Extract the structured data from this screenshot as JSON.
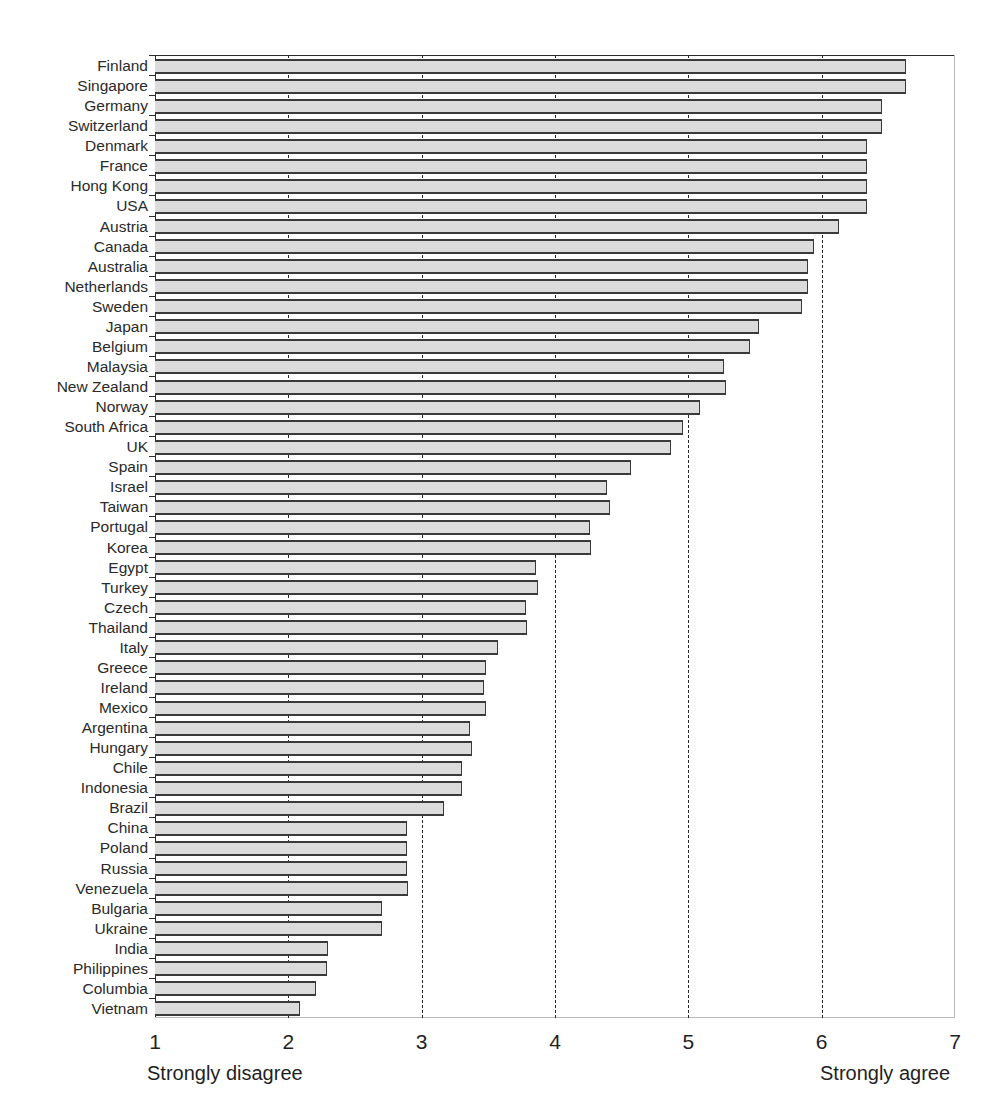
{
  "chart_data": {
    "type": "bar",
    "orientation": "horizontal",
    "title": "",
    "xlabel": "",
    "ylabel": "",
    "xlim": [
      1,
      7
    ],
    "xticks": [
      1,
      2,
      3,
      4,
      5,
      6,
      7
    ],
    "xtick_labels": [
      "1",
      "2",
      "3",
      "4",
      "5",
      "6",
      "7"
    ],
    "gridlines_at": [
      2,
      3,
      4,
      5,
      6
    ],
    "grid": true,
    "legend": null,
    "axis_annotations": {
      "low_anchor": "Strongly disagree",
      "low_anchor_value": 1,
      "high_anchor": "Strongly agree",
      "high_anchor_value": 6
    },
    "bar_color": "#dcdcdc",
    "bar_edge_color": "#3a3a3a",
    "categories": [
      "Finland",
      "Singapore",
      "Germany",
      "Switzerland",
      "Denmark",
      "France",
      "Hong Kong",
      "USA",
      "Austria",
      "Canada",
      "Australia",
      "Netherlands",
      "Sweden",
      "Japan",
      "Belgium",
      "Malaysia",
      "New Zealand",
      "Norway",
      "South Africa",
      "UK",
      "Spain",
      "Israel",
      "Taiwan",
      "Portugal",
      "Korea",
      "Egypt",
      "Turkey",
      "Czech",
      "Thailand",
      "Italy",
      "Greece",
      "Ireland",
      "Mexico",
      "Argentina",
      "Hungary",
      "Chile",
      "Indonesia",
      "Brazil",
      "China",
      "Poland",
      "Russia",
      "Venezuela",
      "Bulgaria",
      "Ukraine",
      "India",
      "Philippines",
      "Columbia",
      "Vietnam"
    ],
    "values": [
      6.63,
      6.63,
      6.45,
      6.45,
      6.34,
      6.34,
      6.34,
      6.34,
      6.13,
      5.94,
      5.9,
      5.9,
      5.85,
      5.53,
      5.46,
      5.27,
      5.28,
      5.09,
      4.96,
      4.87,
      4.57,
      4.39,
      4.41,
      4.26,
      4.27,
      3.86,
      3.87,
      3.78,
      3.79,
      3.57,
      3.48,
      3.47,
      3.48,
      3.36,
      3.38,
      3.3,
      3.3,
      3.17,
      2.89,
      2.89,
      2.89,
      2.9,
      2.7,
      2.7,
      2.3,
      2.29,
      2.21,
      2.09
    ]
  }
}
